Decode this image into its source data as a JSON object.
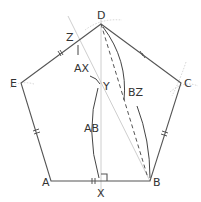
{
  "figure": {
    "points": {
      "A": {
        "label": "A",
        "x": 51,
        "y": 181
      },
      "B": {
        "label": "B",
        "x": 150,
        "y": 181
      },
      "C": {
        "label": "C",
        "x": 181,
        "y": 83
      },
      "D": {
        "label": "D",
        "x": 101,
        "y": 24
      },
      "E": {
        "label": "E",
        "x": 21,
        "y": 83
      },
      "X": {
        "label": "X",
        "x": 101,
        "y": 181
      },
      "Y": {
        "label": "Y",
        "x": 101,
        "y": 84
      },
      "Z": {
        "label": "Z",
        "x": 79,
        "y": 41
      }
    },
    "arc_labels": {
      "AX": "AX",
      "AB": "AB",
      "BZ": "BZ"
    },
    "colors": {
      "edge": "#555555",
      "guide": "#c8c8c8",
      "text": "#333333"
    }
  }
}
